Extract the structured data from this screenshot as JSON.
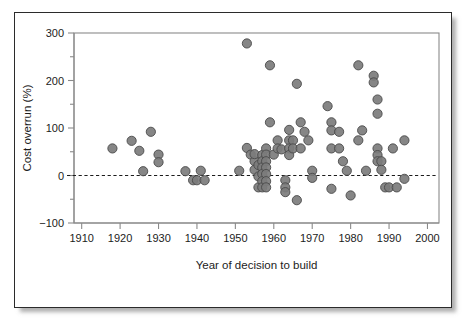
{
  "chart_data": {
    "type": "scatter",
    "title": "",
    "xlabel": "Year of decision to build",
    "ylabel": "Cost overrun (%)",
    "xlim": [
      1908,
      2003
    ],
    "ylim": [
      -100,
      300
    ],
    "xticks": [
      1910,
      1920,
      1930,
      1940,
      1950,
      1960,
      1970,
      1980,
      1990,
      2000
    ],
    "xtick_labels": [
      "1910",
      "1920",
      "1930",
      "1940",
      "1950",
      "1960",
      "1970",
      "1980",
      "1990",
      "2000"
    ],
    "yticks": [
      -100,
      0,
      100,
      200,
      300
    ],
    "ytick_labels": [
      "-100",
      "0",
      "100",
      "200",
      "300"
    ],
    "y_minor_ticks": [
      -50,
      50,
      150,
      250
    ],
    "grid": false,
    "legend": null,
    "reference_lines": [
      {
        "name": "zero-line",
        "orientation": "horizontal",
        "value": 0,
        "style": "dashed"
      }
    ],
    "marker": {
      "shape": "circle",
      "fill_color": "#7c7c7c",
      "edge_color": "#4a4a4a",
      "radius_px": 4.6
    },
    "series": [
      {
        "name": "projects",
        "points": [
          [
            1918,
            57
          ],
          [
            1923,
            73
          ],
          [
            1925,
            52
          ],
          [
            1926,
            9
          ],
          [
            1928,
            92
          ],
          [
            1930,
            44
          ],
          [
            1930,
            28
          ],
          [
            1937,
            9
          ],
          [
            1939,
            -10
          ],
          [
            1940,
            -10
          ],
          [
            1941,
            10
          ],
          [
            1942,
            -10
          ],
          [
            1951,
            10
          ],
          [
            1953,
            278
          ],
          [
            1953,
            58
          ],
          [
            1954,
            44
          ],
          [
            1955,
            30
          ],
          [
            1955,
            45
          ],
          [
            1955,
            12
          ],
          [
            1956,
            -2
          ],
          [
            1956,
            22
          ],
          [
            1956,
            -25
          ],
          [
            1957,
            43
          ],
          [
            1957,
            30
          ],
          [
            1957,
            17
          ],
          [
            1957,
            3
          ],
          [
            1957,
            -12
          ],
          [
            1957,
            -25
          ],
          [
            1958,
            57
          ],
          [
            1958,
            44
          ],
          [
            1958,
            30
          ],
          [
            1958,
            17
          ],
          [
            1958,
            3
          ],
          [
            1958,
            -12
          ],
          [
            1958,
            -25
          ],
          [
            1959,
            232
          ],
          [
            1959,
            112
          ],
          [
            1960,
            44
          ],
          [
            1961,
            74
          ],
          [
            1961,
            57
          ],
          [
            1962,
            55
          ],
          [
            1963,
            -10
          ],
          [
            1963,
            -25
          ],
          [
            1963,
            -35
          ],
          [
            1964,
            96
          ],
          [
            1964,
            74
          ],
          [
            1964,
            57
          ],
          [
            1964,
            43
          ],
          [
            1965,
            74
          ],
          [
            1965,
            57
          ],
          [
            1966,
            193
          ],
          [
            1966,
            -52
          ],
          [
            1967,
            112
          ],
          [
            1967,
            57
          ],
          [
            1968,
            92
          ],
          [
            1969,
            74
          ],
          [
            1970,
            10
          ],
          [
            1970,
            -5
          ],
          [
            1974,
            146
          ],
          [
            1975,
            112
          ],
          [
            1975,
            95
          ],
          [
            1975,
            57
          ],
          [
            1975,
            -28
          ],
          [
            1977,
            92
          ],
          [
            1977,
            57
          ],
          [
            1978,
            30
          ],
          [
            1979,
            10
          ],
          [
            1980,
            -42
          ],
          [
            1982,
            232
          ],
          [
            1982,
            74
          ],
          [
            1983,
            95
          ],
          [
            1984,
            10
          ],
          [
            1986,
            210
          ],
          [
            1986,
            196
          ],
          [
            1987,
            160
          ],
          [
            1987,
            130
          ],
          [
            1987,
            57
          ],
          [
            1987,
            43
          ],
          [
            1987,
            30
          ],
          [
            1988,
            30
          ],
          [
            1988,
            12
          ],
          [
            1989,
            -25
          ],
          [
            1990,
            -25
          ],
          [
            1991,
            57
          ],
          [
            1992,
            -25
          ],
          [
            1994,
            74
          ],
          [
            1994,
            -7
          ]
        ]
      }
    ]
  },
  "axis": {
    "xlabel": "Year of decision to build",
    "ylabel": "Cost overrun (%)"
  }
}
